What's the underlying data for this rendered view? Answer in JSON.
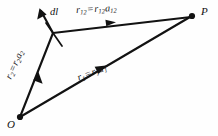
{
  "figure": {
    "background_color": "#fefefe",
    "stroke_color": "#121212",
    "points": [
      {
        "name": "O",
        "label": "O",
        "x": 20,
        "y": 117
      },
      {
        "name": "P",
        "label": "P",
        "x": 192,
        "y": 16
      },
      {
        "name": "source-point",
        "label": "",
        "x": 53,
        "y": 33
      }
    ],
    "labels": {
      "point_p": "P",
      "point_o": "O",
      "dl": {
        "symbol": "d",
        "variable": "l",
        "text": "dl"
      },
      "r12": {
        "lhs_base": "r",
        "lhs_sub": "12",
        "equals": "=",
        "rhs_mag_base": "r",
        "rhs_mag_sub": "12",
        "rhs_unit_base": "a",
        "rhs_unit_sub": "12",
        "text": "r12 = r12a12"
      },
      "r1": {
        "lhs_base": "r",
        "lhs_sub": "1",
        "equals": "=",
        "rhs_mag_base": "r",
        "rhs_mag_sub": "1",
        "rhs_unit_base": "a",
        "rhs_unit_sub": "1",
        "text": "r1 = r1a1"
      },
      "r2": {
        "lhs_base": "r",
        "lhs_sub": "2",
        "equals": "=",
        "rhs_mag_base": "r",
        "rhs_mag_sub": "2",
        "rhs_unit_base": "a",
        "rhs_unit_sub": "2",
        "text": "r2 = r2a2"
      }
    },
    "vectors": [
      {
        "name": "r2",
        "from": "O",
        "to": "source-point",
        "arrow": "midpoint"
      },
      {
        "name": "r1",
        "from": "O",
        "to": "P",
        "arrow": "midpoint"
      },
      {
        "name": "r12",
        "from": "source-point",
        "to": "P",
        "arrow": "midpoint"
      },
      {
        "name": "dl",
        "from": "source-point",
        "to": "up-left",
        "arrow": "tip"
      }
    ]
  }
}
